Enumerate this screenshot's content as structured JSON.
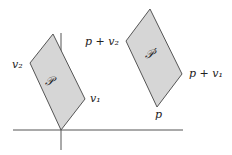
{
  "diagram": {
    "axes": {
      "origin": [
        61,
        130
      ],
      "x_range": [
        13,
        183
      ],
      "y_range": [
        33,
        150
      ],
      "color": "#555555"
    },
    "fill_color": "#d6d6d6",
    "stroke_color": "#555555",
    "shapes": [
      {
        "name": "P",
        "label": "𝒫",
        "points": "61,130 85,99 53,34 30,63",
        "vertex_labels": {
          "v1": "v₁",
          "v2": "v₂"
        }
      },
      {
        "name": "P-prime",
        "label": "𝒫′",
        "points": "157,107 182,74 150,9 126,41",
        "vertex_labels": {
          "p": "p",
          "p_plus_v1": "p + v₁",
          "p_plus_v2": "p + v₂"
        }
      }
    ]
  }
}
